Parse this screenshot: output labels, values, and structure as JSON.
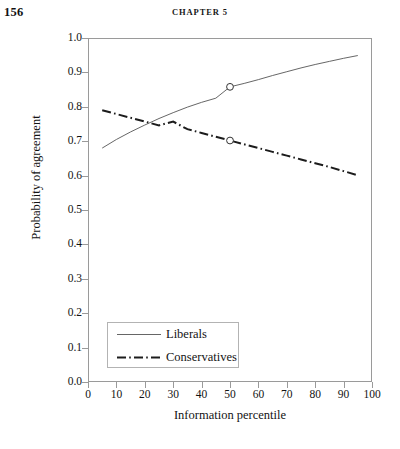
{
  "page": {
    "folio": "156",
    "running_head": "CHAPTER 5"
  },
  "chart_data": {
    "type": "line",
    "title": "",
    "xlabel": "Information percentile",
    "ylabel": "Probability of agreement",
    "xlim": [
      0,
      100
    ],
    "ylim": [
      0.0,
      1.0
    ],
    "grid": false,
    "legend_position": "inside-bottom-left",
    "xticks": [
      0,
      10,
      20,
      30,
      40,
      50,
      60,
      70,
      80,
      90,
      100
    ],
    "xtick_labels": [
      "0",
      "10",
      "20",
      "30",
      "40",
      "50",
      "60",
      "70",
      "80",
      "90",
      "100"
    ],
    "yticks": [
      0.0,
      0.1,
      0.2,
      0.3,
      0.4,
      0.5,
      0.6,
      0.7,
      0.8,
      0.9,
      1.0
    ],
    "ytick_labels": [
      "0.0",
      "0.1",
      "0.2",
      "0.3",
      "0.4",
      "0.5",
      "0.6",
      "0.7",
      "0.8",
      "0.9",
      "1.0"
    ],
    "crossing_point": {
      "x": 22,
      "y": 0.755
    },
    "series": [
      {
        "name": "Liberals",
        "style": "solid",
        "color": "#555555",
        "width": 0.9,
        "x": [
          5,
          10,
          15,
          20,
          25,
          30,
          35,
          40,
          45,
          50,
          55,
          60,
          65,
          70,
          75,
          80,
          85,
          90,
          95
        ],
        "y": [
          0.68,
          0.705,
          0.727,
          0.747,
          0.766,
          0.783,
          0.799,
          0.813,
          0.825,
          0.858,
          0.868,
          0.879,
          0.891,
          0.902,
          0.913,
          0.923,
          0.932,
          0.941,
          0.949
        ],
        "markers": [
          {
            "x": 50,
            "y": 0.858,
            "shape": "open-circle"
          }
        ]
      },
      {
        "name": "Conservatives",
        "style": "dash-dot",
        "color": "#1c1c1c",
        "width": 2.0,
        "x": [
          5,
          10,
          15,
          20,
          25,
          30,
          35,
          40,
          45,
          50,
          55,
          60,
          65,
          70,
          75,
          80,
          85,
          90,
          95
        ],
        "y": [
          0.79,
          0.779,
          0.768,
          0.757,
          0.746,
          0.757,
          0.735,
          0.724,
          0.713,
          0.702,
          0.691,
          0.68,
          0.669,
          0.658,
          0.647,
          0.636,
          0.625,
          0.613,
          0.601
        ],
        "markers": [
          {
            "x": 50,
            "y": 0.702,
            "shape": "open-circle"
          }
        ]
      }
    ],
    "legend": [
      {
        "label": "Liberals",
        "style": "solid"
      },
      {
        "label": "Conservatives",
        "style": "dash-dot"
      }
    ]
  }
}
